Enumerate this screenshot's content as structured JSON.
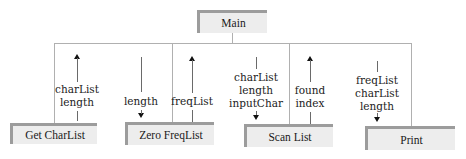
{
  "diagram": {
    "root": {
      "label": "Main"
    },
    "modules": [
      {
        "label": "Get CharList",
        "params_up": [
          "charList",
          "length"
        ],
        "params_down": []
      },
      {
        "label": "Zero FreqList",
        "params_down": [
          "length"
        ],
        "params_up": [
          "freqList"
        ]
      },
      {
        "label": "Scan List",
        "params_down": [
          "charList",
          "length",
          "inputChar"
        ],
        "params_up": [
          "found",
          "index"
        ]
      },
      {
        "label": "Print",
        "params_down": [
          "freqList",
          "charList",
          "length"
        ],
        "params_up": []
      }
    ]
  },
  "colors": {
    "box_fill": "#ededed",
    "box_border": "#9c9c9c",
    "line": "#6a6a6a"
  }
}
